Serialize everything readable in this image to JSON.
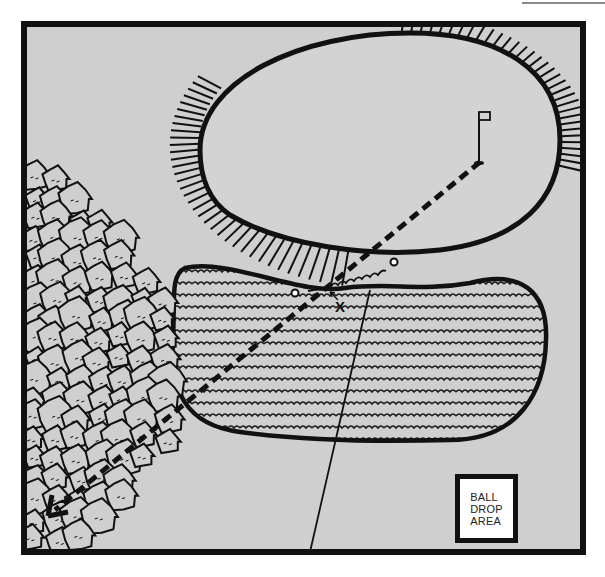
{
  "diagram": {
    "type": "golf-hole-illustration",
    "background_color": "#cfcfcf",
    "frame_color": "#111111",
    "elements": {
      "green": {
        "label": "",
        "shape": "oval"
      },
      "green_fringe": {
        "style": "radial-hatch"
      },
      "bunker": {
        "style": "wavy-lines"
      },
      "trees": {
        "position": "left"
      },
      "flagstick": {
        "position": "on-green"
      },
      "flight_line": {
        "style": "dashed",
        "direction": "from-flag-to-lower-left",
        "end": "arrowhead"
      },
      "ball_path": {
        "style": "wavy"
      },
      "reference_line": {
        "style": "thin-solid"
      }
    },
    "labels": {
      "ball_position": "X",
      "drop_area": "BALL\nDROP\nAREA"
    }
  }
}
